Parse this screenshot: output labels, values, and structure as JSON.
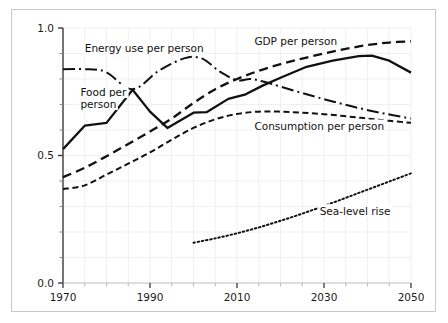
{
  "chart_data": {
    "type": "line",
    "title": "",
    "subtitle": "",
    "xlabel": "",
    "ylabel": "",
    "xlim": [
      1970,
      2050
    ],
    "ylim": [
      0.0,
      1.0
    ],
    "grid": true,
    "grid_color": "#f0f0f0",
    "legend_position": "inline-annotations",
    "background": "#ffffff",
    "frame_color": "#c9c9c9",
    "line_color": "#111111",
    "x_ticks_major": [
      1970,
      1990,
      2010,
      2030,
      2050
    ],
    "x_tick_labels": [
      "1970",
      "1990",
      "2010",
      "2030",
      "2050"
    ],
    "x_tick_minor_step": 5,
    "y_ticks_major": [
      0.0,
      0.5,
      1.0
    ],
    "y_tick_labels": [
      "0.0",
      "0.5",
      "1.0"
    ],
    "y_tick_minor_step": 0.1,
    "series": [
      {
        "name": "GDP per person",
        "label": "GDP per person",
        "style": "dashed",
        "dasharray": "9,5",
        "width": 2.3,
        "x": [
          1970,
          1975,
          1980,
          1985,
          1990,
          1995,
          2000,
          2005,
          2010,
          2015,
          2020,
          2025,
          2030,
          2035,
          2040,
          2045,
          2050
        ],
        "y": [
          0.415,
          0.452,
          0.497,
          0.545,
          0.594,
          0.645,
          0.706,
          0.76,
          0.8,
          0.832,
          0.858,
          0.88,
          0.9,
          0.918,
          0.933,
          0.943,
          0.948
        ]
      },
      {
        "name": "Food per person",
        "label": "Food per person",
        "style": "solid",
        "dasharray": "none",
        "width": 2.3,
        "x": [
          1970,
          1975,
          1980,
          1986,
          1990,
          1994,
          2000,
          2003,
          2008,
          2012,
          2016,
          2020,
          2026,
          2032,
          2038,
          2041,
          2045,
          2050
        ],
        "y": [
          0.525,
          0.617,
          0.628,
          0.758,
          0.672,
          0.608,
          0.668,
          0.67,
          0.722,
          0.74,
          0.775,
          0.805,
          0.848,
          0.872,
          0.89,
          0.892,
          0.872,
          0.825
        ]
      },
      {
        "name": "Energy use per person",
        "label": "Energy use per person",
        "style": "dashdot",
        "dasharray": "12,4,2,4",
        "width": 2.0,
        "x": [
          1970,
          1976,
          1980,
          1986,
          1992,
          1998,
          2002,
          2006,
          2010,
          2013,
          2016,
          2020,
          2026,
          2032,
          2038,
          2044,
          2050
        ],
        "y": [
          0.838,
          0.838,
          0.826,
          0.76,
          0.832,
          0.882,
          0.88,
          0.83,
          0.795,
          0.8,
          0.79,
          0.77,
          0.74,
          0.712,
          0.686,
          0.664,
          0.645
        ]
      },
      {
        "name": "Consumption per person",
        "label": "Consumption per person",
        "style": "densely-dashed",
        "dasharray": "6,3.5",
        "width": 2.0,
        "x": [
          1970,
          1975,
          1980,
          1985,
          1990,
          1995,
          2000,
          2005,
          2010,
          2015,
          2020,
          2025,
          2030,
          2035,
          2040,
          2045,
          2050
        ],
        "y": [
          0.368,
          0.383,
          0.425,
          0.468,
          0.512,
          0.562,
          0.608,
          0.642,
          0.663,
          0.672,
          0.672,
          0.668,
          0.662,
          0.654,
          0.645,
          0.636,
          0.628
        ]
      },
      {
        "name": "Sea-level rise",
        "label": "Sea-level rise",
        "style": "dotted",
        "dasharray": "1.6,2.6",
        "width": 2.0,
        "x": [
          2000,
          2005,
          2010,
          2015,
          2020,
          2025,
          2030,
          2035,
          2040,
          2045,
          2050
        ],
        "y": [
          0.158,
          0.175,
          0.195,
          0.218,
          0.244,
          0.272,
          0.302,
          0.334,
          0.366,
          0.398,
          0.43
        ]
      }
    ],
    "annotations": [
      {
        "text": "Energy use per person",
        "x": 1975,
        "y": 0.905,
        "anchor": "start"
      },
      {
        "text": "GDP per person",
        "x": 2014,
        "y": 0.935,
        "anchor": "start"
      },
      {
        "text": "Food per",
        "x": 1974,
        "y": 0.735,
        "anchor": "start"
      },
      {
        "text": "person",
        "x": 1974,
        "y": 0.688,
        "anchor": "start"
      },
      {
        "text": "Consumption per person",
        "x": 2014,
        "y": 0.6,
        "anchor": "start"
      },
      {
        "text": "Sea-level rise",
        "x": 2029,
        "y": 0.268,
        "anchor": "start"
      }
    ]
  }
}
